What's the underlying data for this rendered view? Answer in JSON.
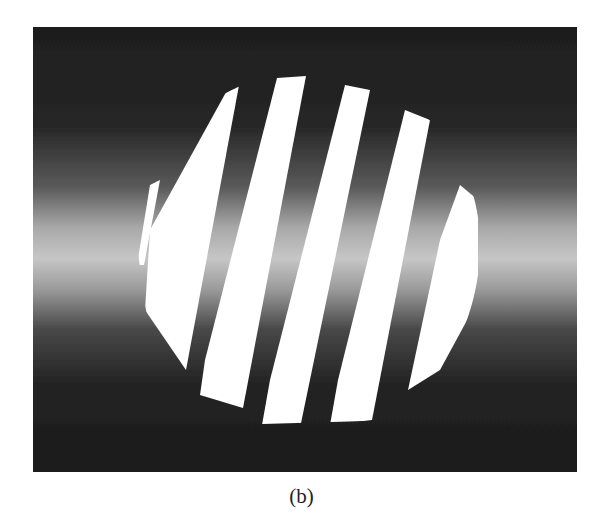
{
  "figure": {
    "caption": "(b)",
    "fringe_count": 6,
    "colors": {
      "background_dark": "#1c1c1c",
      "band_bright": "#c8c8c8",
      "fringe": "#ffffff",
      "page": "#ffffff"
    }
  }
}
